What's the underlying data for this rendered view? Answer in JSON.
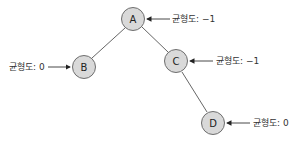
{
  "diagram": {
    "type": "binary-tree",
    "nodes": [
      {
        "id": "A",
        "label": "A",
        "balance_label": "균형도: −1"
      },
      {
        "id": "B",
        "label": "B",
        "balance_label": "균형도: 0"
      },
      {
        "id": "C",
        "label": "C",
        "balance_label": "균형도: −1"
      },
      {
        "id": "D",
        "label": "D",
        "balance_label": "균형도: 0"
      }
    ],
    "edges": [
      {
        "from": "A",
        "to": "B"
      },
      {
        "from": "A",
        "to": "C"
      },
      {
        "from": "C",
        "to": "D"
      }
    ]
  }
}
